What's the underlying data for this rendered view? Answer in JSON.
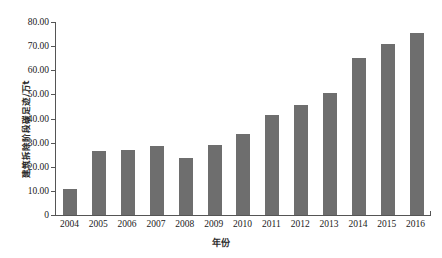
{
  "chart_data": {
    "type": "bar",
    "title": "",
    "xlabel": "年份",
    "ylabel": "建筑拆除阶段碳足迹/万t",
    "categories": [
      "2004",
      "2005",
      "2006",
      "2007",
      "2008",
      "2009",
      "2010",
      "2011",
      "2012",
      "2013",
      "2014",
      "2015",
      "2016"
    ],
    "values": [
      10.7,
      26.5,
      26.8,
      28.6,
      23.6,
      29.2,
      33.5,
      41.3,
      45.4,
      50.6,
      65.0,
      70.8,
      75.6
    ],
    "ylim": [
      0,
      80
    ],
    "ytick_values": [
      0,
      10,
      20,
      30,
      40,
      50,
      60,
      70,
      80
    ],
    "ytick_labels": [
      "0",
      "10.00",
      "20.00",
      "30.00",
      "40.00",
      "50.00",
      "60.00",
      "70.00",
      "80.00"
    ],
    "grid": false,
    "legend": null,
    "legend_position": "none",
    "series": [
      {
        "name": "建筑拆除阶段碳足迹",
        "color": "#6e6e6e",
        "values": [
          10.7,
          26.5,
          26.8,
          28.6,
          23.6,
          29.2,
          33.5,
          41.3,
          45.4,
          50.6,
          65.0,
          70.8,
          75.6
        ]
      }
    ],
    "bar_color": "#6e6e6e",
    "axis_color": "#555555",
    "background": "#ffffff"
  }
}
